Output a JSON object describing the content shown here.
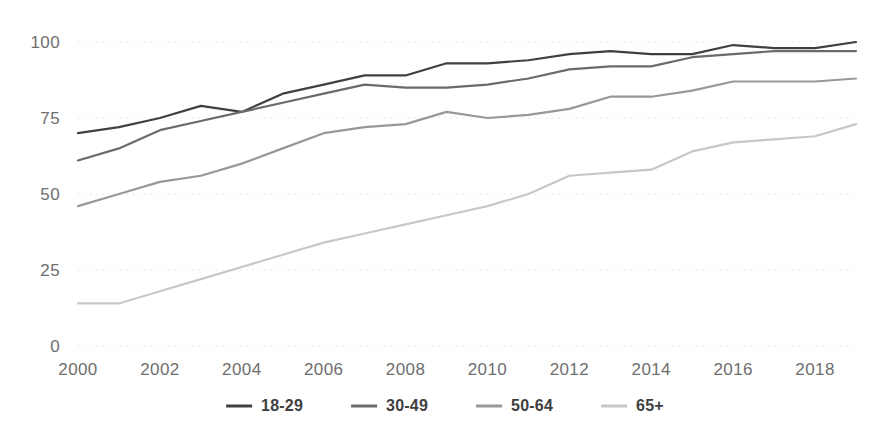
{
  "chart_data": {
    "type": "line",
    "title": "",
    "subtitle": "",
    "xlabel": "",
    "ylabel": "",
    "x": [
      2000,
      2001,
      2002,
      2003,
      2004,
      2005,
      2006,
      2007,
      2008,
      2009,
      2010,
      2011,
      2012,
      2013,
      2014,
      2015,
      2016,
      2017,
      2018,
      2019
    ],
    "xlim": [
      2000,
      2019
    ],
    "ylim": [
      0,
      100
    ],
    "xticks": [
      2000,
      2002,
      2004,
      2006,
      2008,
      2010,
      2012,
      2014,
      2016,
      2018
    ],
    "xtick_labels": [
      "2000",
      "2002",
      "2004",
      "2006",
      "2008",
      "2010",
      "2012",
      "2014",
      "2016",
      "2018"
    ],
    "yticks": [
      0,
      25,
      50,
      75,
      100
    ],
    "ytick_labels": [
      "0",
      "25",
      "50",
      "75",
      "100"
    ],
    "grid": true,
    "grid_axis": "y",
    "grid_style": "dotted",
    "legend_position": "bottom",
    "series": [
      {
        "name": "18-29",
        "color": "#404040",
        "values": [
          70,
          72,
          75,
          79,
          77,
          83,
          86,
          89,
          89,
          93,
          93,
          94,
          96,
          97,
          96,
          96,
          99,
          98,
          98,
          100
        ]
      },
      {
        "name": "30-49",
        "color": "#6b6b6b",
        "values": [
          61,
          65,
          71,
          74,
          77,
          80,
          83,
          86,
          85,
          85,
          86,
          88,
          91,
          92,
          92,
          95,
          96,
          97,
          97,
          97
        ]
      },
      {
        "name": "50-64",
        "color": "#989898",
        "values": [
          46,
          50,
          54,
          56,
          60,
          65,
          70,
          72,
          73,
          77,
          75,
          76,
          78,
          82,
          82,
          84,
          87,
          87,
          87,
          88
        ]
      },
      {
        "name": "65+",
        "color": "#c8c8c8",
        "values": [
          14,
          14,
          18,
          22,
          26,
          30,
          34,
          37,
          40,
          43,
          46,
          50,
          56,
          57,
          58,
          64,
          67,
          68,
          69,
          73
        ]
      }
    ]
  },
  "legend": {
    "items": [
      {
        "label": "18-29",
        "color": "#404040"
      },
      {
        "label": "30-49",
        "color": "#6b6b6b"
      },
      {
        "label": "50-64",
        "color": "#989898"
      },
      {
        "label": "65+",
        "color": "#c8c8c8"
      }
    ]
  },
  "colors": {
    "background": "#ffffff",
    "gridline": "#d9d9d9",
    "tick_text": "#6e6e6e",
    "legend_text": "#3f3f3f"
  }
}
